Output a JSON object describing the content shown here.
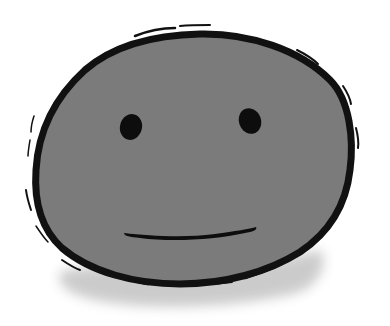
{
  "illustration": {
    "subject": "neutral-face-blob",
    "caption": "",
    "colors": {
      "background": "#ffffff",
      "face_fill": "#7b7b7b",
      "outline": "#111111",
      "shadow": "#c9c9c9",
      "features": "#0d0d0d"
    }
  }
}
